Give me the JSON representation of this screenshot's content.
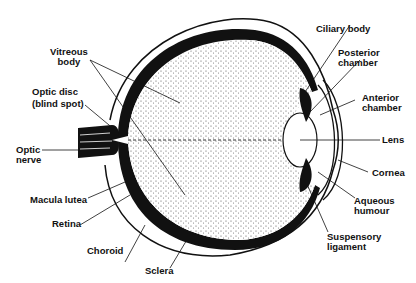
{
  "diagram": {
    "colors": {
      "ink": "#111111",
      "background": "#ffffff",
      "stipple": "#555555"
    },
    "labels": [
      {
        "id": "vitreous-body",
        "line1": "Vitreous",
        "line2": "body"
      },
      {
        "id": "optic-disc",
        "line1": "Optic disc",
        "line2": "(blind spot)"
      },
      {
        "id": "optic-nerve",
        "line1": "Optic",
        "line2": "nerve"
      },
      {
        "id": "macula-lutea",
        "line1": "Macula lutea"
      },
      {
        "id": "retina",
        "line1": "Retina"
      },
      {
        "id": "choroid",
        "line1": "Choroid"
      },
      {
        "id": "sclera",
        "line1": "Sclera"
      },
      {
        "id": "ciliary-body",
        "line1": "Ciliary body"
      },
      {
        "id": "posterior-chamber",
        "line1": "Posterior",
        "line2": "chamber"
      },
      {
        "id": "anterior-chamber",
        "line1": "Anterior",
        "line2": "chamber"
      },
      {
        "id": "lens",
        "line1": "Lens"
      },
      {
        "id": "cornea",
        "line1": "Cornea"
      },
      {
        "id": "aqueous-humour",
        "line1": "Aqueous",
        "line2": "humour"
      },
      {
        "id": "suspensory-ligament",
        "line1": "Suspensory",
        "line2": "ligament"
      }
    ]
  }
}
